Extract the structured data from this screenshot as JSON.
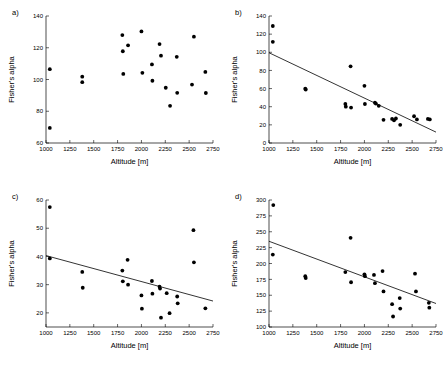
{
  "figure": {
    "panels": [
      "a)",
      "b)",
      "c)",
      "d)"
    ]
  },
  "chart_data": [
    {
      "type": "scatter",
      "panel_label": "a)",
      "title": "",
      "xlabel": "Altitude [m]",
      "ylabel": "Fisher's alpha",
      "xlim": [
        1000,
        2750
      ],
      "ylim": [
        60,
        140
      ],
      "xticks": [
        1000,
        1250,
        1500,
        1750,
        2000,
        2250,
        2500,
        2750
      ],
      "yticks": [
        60,
        80,
        100,
        120,
        140
      ],
      "grid": false,
      "legend": "none",
      "has_fit_line": false,
      "points": [
        {
          "x": 1040,
          "y": 106.5
        },
        {
          "x": 1040,
          "y": 69.5
        },
        {
          "x": 1380,
          "y": 101.8
        },
        {
          "x": 1380,
          "y": 98.3
        },
        {
          "x": 1800,
          "y": 128.0
        },
        {
          "x": 1805,
          "y": 117.8
        },
        {
          "x": 1810,
          "y": 103.5
        },
        {
          "x": 1860,
          "y": 121.5
        },
        {
          "x": 2000,
          "y": 130.3
        },
        {
          "x": 2010,
          "y": 104.2
        },
        {
          "x": 2110,
          "y": 109.5
        },
        {
          "x": 2115,
          "y": 99.2
        },
        {
          "x": 2190,
          "y": 122.3
        },
        {
          "x": 2205,
          "y": 115.0
        },
        {
          "x": 2255,
          "y": 94.8
        },
        {
          "x": 2300,
          "y": 83.4
        },
        {
          "x": 2370,
          "y": 114.3
        },
        {
          "x": 2375,
          "y": 91.6
        },
        {
          "x": 2530,
          "y": 96.8
        },
        {
          "x": 2550,
          "y": 127.0
        },
        {
          "x": 2670,
          "y": 104.8
        },
        {
          "x": 2675,
          "y": 91.5
        }
      ]
    },
    {
      "type": "scatter",
      "panel_label": "b)",
      "title": "",
      "xlabel": "Altitude [m]",
      "ylabel": "Fisher's alpha",
      "xlim": [
        1000,
        2750
      ],
      "ylim": [
        0,
        140
      ],
      "xticks": [
        1000,
        1250,
        1500,
        1750,
        2000,
        2250,
        2500,
        2750
      ],
      "yticks": [
        0,
        20,
        40,
        60,
        80,
        100,
        120,
        140
      ],
      "grid": false,
      "legend": "none",
      "has_fit_line": true,
      "fit_line": {
        "x1": 1000,
        "y1": 99.5,
        "x2": 2750,
        "y2": 12.0
      },
      "points": [
        {
          "x": 1040,
          "y": 129.0
        },
        {
          "x": 1040,
          "y": 111.5
        },
        {
          "x": 1380,
          "y": 59.8
        },
        {
          "x": 1385,
          "y": 59.0
        },
        {
          "x": 1800,
          "y": 43.0
        },
        {
          "x": 1805,
          "y": 40.0
        },
        {
          "x": 1855,
          "y": 84.5
        },
        {
          "x": 1860,
          "y": 39.0
        },
        {
          "x": 2000,
          "y": 63.0
        },
        {
          "x": 2005,
          "y": 43.0
        },
        {
          "x": 2110,
          "y": 44.5
        },
        {
          "x": 2120,
          "y": 43.5
        },
        {
          "x": 2150,
          "y": 41.0
        },
        {
          "x": 2200,
          "y": 25.5
        },
        {
          "x": 2290,
          "y": 26.5
        },
        {
          "x": 2310,
          "y": 25.0
        },
        {
          "x": 2330,
          "y": 27.0
        },
        {
          "x": 2375,
          "y": 20.0
        },
        {
          "x": 2520,
          "y": 29.5
        },
        {
          "x": 2550,
          "y": 26.0
        },
        {
          "x": 2665,
          "y": 26.5
        },
        {
          "x": 2685,
          "y": 26.0
        }
      ]
    },
    {
      "type": "scatter",
      "panel_label": "c)",
      "title": "",
      "xlabel": "Altitude [m]",
      "ylabel": "Fisher's alpha",
      "xlim": [
        1000,
        2750
      ],
      "ylim": [
        15,
        60
      ],
      "xticks": [
        1000,
        1250,
        1500,
        1750,
        2000,
        2250,
        2500,
        2750
      ],
      "yticks": [
        20,
        30,
        40,
        50,
        60
      ],
      "grid": false,
      "legend": "none",
      "has_fit_line": true,
      "fit_line": {
        "x1": 1000,
        "y1": 40.3,
        "x2": 2750,
        "y2": 24.2
      },
      "points": [
        {
          "x": 1040,
          "y": 57.5
        },
        {
          "x": 1040,
          "y": 39.3
        },
        {
          "x": 1380,
          "y": 34.5
        },
        {
          "x": 1385,
          "y": 28.9
        },
        {
          "x": 1800,
          "y": 35.0
        },
        {
          "x": 1805,
          "y": 31.2
        },
        {
          "x": 1855,
          "y": 38.8
        },
        {
          "x": 1860,
          "y": 30.0
        },
        {
          "x": 2000,
          "y": 26.2
        },
        {
          "x": 2005,
          "y": 21.5
        },
        {
          "x": 2110,
          "y": 31.3
        },
        {
          "x": 2115,
          "y": 26.8
        },
        {
          "x": 2190,
          "y": 29.3
        },
        {
          "x": 2195,
          "y": 28.6
        },
        {
          "x": 2205,
          "y": 18.3
        },
        {
          "x": 2265,
          "y": 27.0
        },
        {
          "x": 2295,
          "y": 19.9
        },
        {
          "x": 2375,
          "y": 25.8
        },
        {
          "x": 2380,
          "y": 23.4
        },
        {
          "x": 2545,
          "y": 49.3
        },
        {
          "x": 2550,
          "y": 37.9
        },
        {
          "x": 2670,
          "y": 21.6
        }
      ]
    },
    {
      "type": "scatter",
      "panel_label": "d)",
      "title": "",
      "xlabel": "Altitude [m]",
      "ylabel": "Fisher's alpha",
      "xlim": [
        1000,
        2750
      ],
      "ylim": [
        100,
        300
      ],
      "xticks": [
        1000,
        1250,
        1500,
        1750,
        2000,
        2250,
        2500,
        2750
      ],
      "yticks": [
        100,
        125,
        150,
        175,
        200,
        225,
        250,
        275,
        300
      ],
      "grid": false,
      "legend": "none",
      "has_fit_line": true,
      "fit_line": {
        "x1": 1000,
        "y1": 235.0,
        "x2": 2750,
        "y2": 137.0
      },
      "points": [
        {
          "x": 1045,
          "y": 292.0
        },
        {
          "x": 1040,
          "y": 214.0
        },
        {
          "x": 1380,
          "y": 180.0
        },
        {
          "x": 1385,
          "y": 177.0
        },
        {
          "x": 1800,
          "y": 186.5
        },
        {
          "x": 1855,
          "y": 240.5
        },
        {
          "x": 1860,
          "y": 170.5
        },
        {
          "x": 2000,
          "y": 183.0
        },
        {
          "x": 2005,
          "y": 180.0
        },
        {
          "x": 2100,
          "y": 182.0
        },
        {
          "x": 2110,
          "y": 169.0
        },
        {
          "x": 2190,
          "y": 188.0
        },
        {
          "x": 2200,
          "y": 156.0
        },
        {
          "x": 2290,
          "y": 136.0
        },
        {
          "x": 2300,
          "y": 116.5
        },
        {
          "x": 2370,
          "y": 145.5
        },
        {
          "x": 2375,
          "y": 129.0
        },
        {
          "x": 2530,
          "y": 184.0
        },
        {
          "x": 2540,
          "y": 156.0
        },
        {
          "x": 2675,
          "y": 138.0
        },
        {
          "x": 2680,
          "y": 130.5
        }
      ]
    }
  ]
}
